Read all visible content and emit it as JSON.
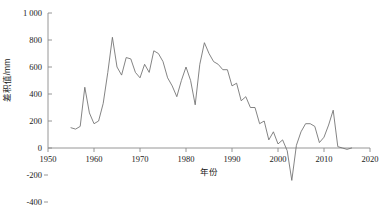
{
  "chart_data": {
    "type": "line",
    "title": "",
    "xlabel": "年份",
    "ylabel": "差积值/mm",
    "xlim": [
      1950,
      2020
    ],
    "ylim": [
      -400,
      1000
    ],
    "grid": false,
    "legend": "none",
    "xticks": [
      1950,
      1960,
      1970,
      1980,
      1990,
      2000,
      2010,
      2020
    ],
    "xticklabels": [
      "1950",
      "1960",
      "1970",
      "1980",
      "1990",
      "2000",
      "2010",
      "2020"
    ],
    "yticks": [
      -400,
      -200,
      0,
      200,
      400,
      600,
      800,
      1000
    ],
    "yticklabels": [
      "-400",
      "-200",
      "0",
      "200",
      "400",
      "600",
      "800",
      "1 000"
    ],
    "line_color": "#6e6e6e",
    "series": [
      {
        "name": "差积值",
        "x": [
          1955,
          1956,
          1957,
          1958,
          1959,
          1960,
          1961,
          1962,
          1963,
          1964,
          1965,
          1966,
          1967,
          1968,
          1969,
          1970,
          1971,
          1972,
          1973,
          1974,
          1975,
          1976,
          1977,
          1978,
          1979,
          1980,
          1981,
          1982,
          1983,
          1984,
          1985,
          1986,
          1987,
          1988,
          1989,
          1990,
          1991,
          1992,
          1993,
          1994,
          1995,
          1996,
          1997,
          1998,
          1999,
          2000,
          2001,
          2002,
          2003,
          2004,
          2005,
          2006,
          2007,
          2008,
          2009,
          2010,
          2011,
          2012,
          2013,
          2014,
          2015,
          2016
        ],
        "values": [
          150,
          140,
          160,
          450,
          260,
          180,
          200,
          330,
          560,
          820,
          600,
          540,
          670,
          660,
          560,
          520,
          620,
          560,
          720,
          700,
          640,
          520,
          460,
          380,
          500,
          600,
          500,
          320,
          620,
          780,
          700,
          640,
          620,
          580,
          580,
          460,
          480,
          350,
          380,
          300,
          300,
          180,
          200,
          60,
          120,
          30,
          60,
          -20,
          -240,
          20,
          120,
          180,
          180,
          160,
          40,
          80,
          170,
          280,
          10,
          0,
          -10,
          0
        ]
      }
    ]
  }
}
